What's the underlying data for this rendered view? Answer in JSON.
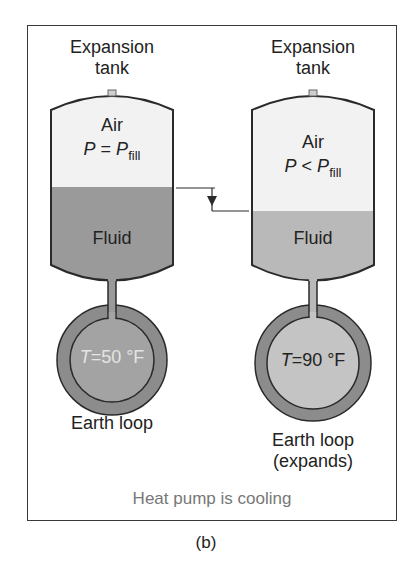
{
  "figure": {
    "caption": "(b)",
    "status_text": "Heat pump is cooling",
    "colors": {
      "air": "#f2f2f2",
      "fluid_left": "#9a9a9a",
      "fluid_right": "#b9b9b9",
      "loop_ring": "#8c8c8c",
      "loop_inner_left": "#a3a3a3",
      "loop_inner_right": "#c4c4c4",
      "outline": "#2a2a2a",
      "status_text": "#777777"
    }
  },
  "left_system": {
    "tank_label_line1": "Expansion",
    "tank_label_line2": "tank",
    "air_label": "Air",
    "pressure_var": "P",
    "pressure_relation": " = ",
    "pressure_ref": "P",
    "pressure_sub": "fill",
    "fluid_label": "Fluid",
    "temp_var": "T",
    "temp_value": "=50 °F",
    "loop_label": "Earth loop"
  },
  "right_system": {
    "tank_label_line1": "Expansion",
    "tank_label_line2": "tank",
    "air_label": "Air",
    "pressure_var": "P",
    "pressure_relation": " < ",
    "pressure_ref": "P",
    "pressure_sub": "fill",
    "fluid_label": "Fluid",
    "temp_var": "T",
    "temp_value": "=90 °F",
    "loop_label_line1": "Earth loop",
    "loop_label_line2": "(expands)"
  },
  "level_indicator": {
    "description": "fluid level drop arrow",
    "left_level_y": 187,
    "right_level_y": 211
  }
}
